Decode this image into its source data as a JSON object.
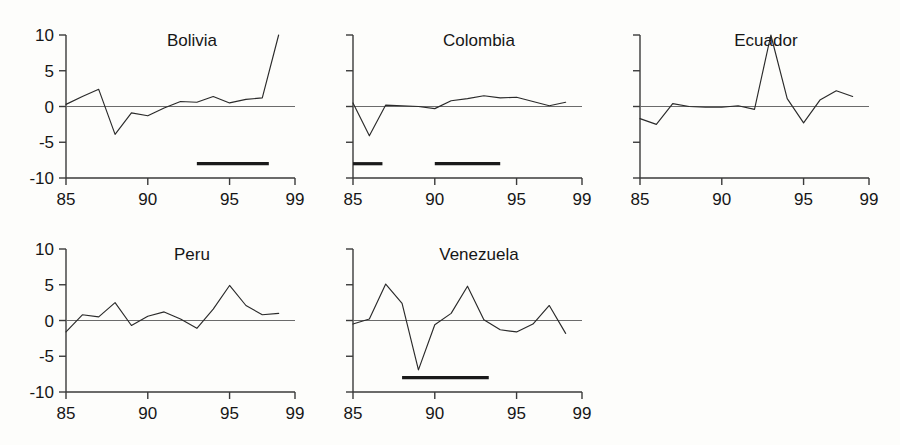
{
  "figure": {
    "kind": "small-multiples-line-panels",
    "background_color": "#fdfdfb",
    "line_color": "#2a2a2a",
    "axis_color": "#3a3a3a",
    "zero_line_color": "#6b6b6b",
    "period_bar_color": "#1a1a1a",
    "rows": 2,
    "columns": 3
  },
  "chart_data": {
    "type": "line",
    "title": "",
    "xlabel": "",
    "ylabel": "",
    "xlim": [
      85,
      99
    ],
    "ylim": [
      -10,
      10
    ],
    "grid": false,
    "legend": "none",
    "x_tick_labels": [
      "85",
      "90",
      "95",
      "99"
    ],
    "x_tick_values": [
      85,
      90,
      95,
      99
    ],
    "y_tick_labels": [
      "10",
      "5",
      "0",
      "-5",
      "-10"
    ],
    "y_tick_values": [
      10,
      5,
      0,
      -5,
      -10
    ],
    "zero_reference_line": 0,
    "panels": [
      {
        "name": "Bolivia",
        "row": 0,
        "col": 0,
        "show_y_axis_labels": true,
        "x": [
          85,
          86,
          87,
          88,
          89,
          90,
          91,
          92,
          93,
          94,
          95,
          96,
          97,
          98
        ],
        "values": [
          0.3,
          1.4,
          2.4,
          -3.9,
          -0.9,
          -1.3,
          -0.2,
          0.7,
          0.6,
          1.4,
          0.5,
          1.0,
          1.2,
          10.0
        ],
        "period_bars": [
          {
            "start": 93.0,
            "end": 97.4,
            "y": -8
          }
        ]
      },
      {
        "name": "Colombia",
        "row": 0,
        "col": 1,
        "show_y_axis_labels": false,
        "x": [
          85,
          86,
          87,
          88,
          89,
          90,
          91,
          92,
          93,
          94,
          95,
          96,
          97,
          98
        ],
        "values": [
          0.5,
          -4.1,
          0.2,
          0.1,
          0.0,
          -0.3,
          0.8,
          1.1,
          1.5,
          1.2,
          1.3,
          0.7,
          0.1,
          0.6
        ],
        "period_bars": [
          {
            "start": 85.0,
            "end": 86.8,
            "y": -8
          },
          {
            "start": 90.0,
            "end": 94.0,
            "y": -8
          }
        ]
      },
      {
        "name": "Ecuador",
        "row": 0,
        "col": 2,
        "show_y_axis_labels": false,
        "x": [
          85,
          86,
          87,
          88,
          89,
          90,
          91,
          92,
          93,
          94,
          95,
          96,
          97,
          98
        ],
        "values": [
          -1.7,
          -2.5,
          0.4,
          0.0,
          -0.1,
          -0.1,
          0.1,
          -0.4,
          10.0,
          1.1,
          -2.3,
          0.9,
          2.2,
          1.4
        ],
        "period_bars": []
      },
      {
        "name": "Peru",
        "row": 1,
        "col": 0,
        "show_y_axis_labels": true,
        "x": [
          85,
          86,
          87,
          88,
          89,
          90,
          91,
          92,
          93,
          94,
          95,
          96,
          97,
          98
        ],
        "values": [
          -1.6,
          0.8,
          0.5,
          2.5,
          -0.7,
          0.6,
          1.2,
          0.2,
          -1.1,
          1.6,
          4.9,
          2.1,
          0.8,
          1.0
        ],
        "period_bars": []
      },
      {
        "name": "Venezuela",
        "row": 1,
        "col": 1,
        "show_y_axis_labels": false,
        "x": [
          85,
          86,
          87,
          88,
          89,
          90,
          91,
          92,
          93,
          94,
          95,
          96,
          97,
          98
        ],
        "values": [
          -0.5,
          0.2,
          5.1,
          2.4,
          -6.9,
          -0.6,
          1.0,
          4.8,
          0.1,
          -1.3,
          -1.6,
          -0.5,
          2.1,
          -1.8
        ],
        "period_bars": [
          {
            "start": 88.0,
            "end": 93.3,
            "y": -8
          }
        ]
      }
    ]
  }
}
